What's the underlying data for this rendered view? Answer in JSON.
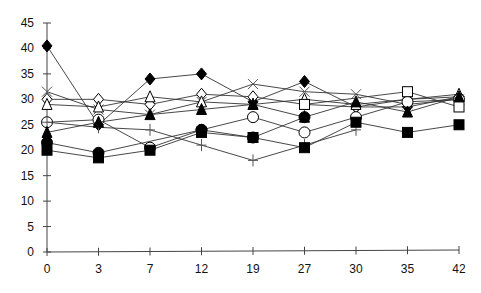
{
  "chart_data": {
    "type": "line",
    "title": "",
    "xlabel": "",
    "ylabel": "",
    "categories": [
      "0",
      "3",
      "7",
      "12",
      "19",
      "27",
      "30",
      "35",
      "42"
    ],
    "yticks": [
      0,
      5,
      10,
      15,
      20,
      25,
      30,
      35,
      40,
      45
    ],
    "ylim": [
      0,
      45
    ],
    "grid": false,
    "legend": "none",
    "series": [
      {
        "name": "filled-diamond",
        "marker": "diamond",
        "filled": true,
        "values": [
          40.5,
          25,
          34,
          35,
          29.5,
          33.5,
          28.5,
          28.5,
          30.5
        ]
      },
      {
        "name": "open-diamond",
        "marker": "diamond",
        "filled": false,
        "values": [
          30,
          30,
          29,
          31,
          30.5,
          29,
          28.5,
          30,
          30.5
        ]
      },
      {
        "name": "x-mark",
        "marker": "x",
        "filled": false,
        "values": [
          31.5,
          28,
          27,
          29.5,
          33,
          31.5,
          31,
          29,
          30
        ]
      },
      {
        "name": "open-triangle",
        "marker": "triangle",
        "filled": false,
        "values": [
          29,
          28.5,
          30.5,
          29.5,
          29,
          30,
          29,
          30,
          31
        ]
      },
      {
        "name": "open-circle",
        "marker": "circle",
        "filled": false,
        "values": [
          25.5,
          26,
          20.5,
          24,
          26.5,
          23.5,
          26.5,
          29.5,
          30
        ]
      },
      {
        "name": "plus",
        "marker": "plus",
        "filled": false,
        "values": [
          25.5,
          24.5,
          24,
          21,
          18,
          21,
          24,
          null,
          null
        ]
      },
      {
        "name": "filled-triangle",
        "marker": "triangle",
        "filled": true,
        "values": [
          23.5,
          25.5,
          27,
          28,
          29,
          26.5,
          29.5,
          27.5,
          30.5
        ]
      },
      {
        "name": "filled-circle",
        "marker": "circle",
        "filled": true,
        "values": [
          21.5,
          19.5,
          null,
          24,
          22.5,
          26.5,
          null,
          null,
          null
        ]
      },
      {
        "name": "filled-square",
        "marker": "square",
        "filled": true,
        "values": [
          20,
          18.5,
          20,
          23.5,
          22.5,
          20.5,
          25.5,
          23.5,
          25
        ]
      },
      {
        "name": "open-square",
        "marker": "square",
        "filled": false,
        "values": [
          null,
          null,
          null,
          null,
          null,
          29,
          null,
          31.5,
          28.5
        ]
      }
    ]
  }
}
